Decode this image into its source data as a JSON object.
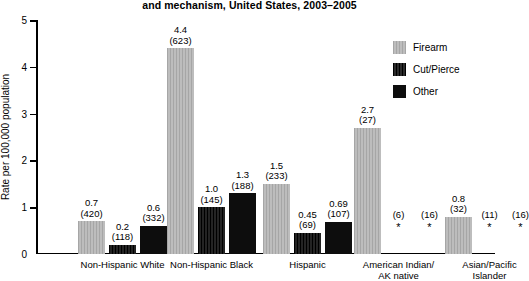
{
  "chart_data": {
    "type": "bar",
    "title": "and mechanism, United States, 2003–2005",
    "xlabel": "",
    "ylabel": "Rate per 100,000 population",
    "ylim": [
      0,
      5
    ],
    "yticks": [
      "0",
      "1",
      "2",
      "3",
      "4",
      "5"
    ],
    "grid": false,
    "legend_position": "top-right",
    "categories": [
      "Non-Hispanic White",
      "Non-Hispanic Black",
      "Hispanic",
      "American Indian/\nAK native",
      "Asian/Pacific\nIslander"
    ],
    "series": [
      {
        "name": "Firearm",
        "color": "#b3b3b3",
        "values": [
          0.7,
          4.4,
          1.5,
          2.7,
          0.8
        ],
        "rate_labels": [
          "0.7",
          "4.4",
          "1.5",
          "2.7",
          "0.8"
        ],
        "count_labels": [
          "(420)",
          "(623)",
          "(233)",
          "(27)",
          "(32)"
        ],
        "suppressed": [
          false,
          false,
          false,
          false,
          false
        ]
      },
      {
        "name": "Cut/Pierce",
        "color": "#161616",
        "values": [
          0.2,
          1.0,
          0.45,
          null,
          null
        ],
        "rate_labels": [
          "0.2",
          "1.0",
          "0.45",
          "",
          ""
        ],
        "count_labels": [
          "(118)",
          "(145)",
          "(69)",
          "(6)",
          "(11)"
        ],
        "suppressed": [
          false,
          false,
          false,
          true,
          true
        ]
      },
      {
        "name": "Other",
        "color": "#0d0d0d",
        "values": [
          0.6,
          1.3,
          0.69,
          null,
          null
        ],
        "rate_labels": [
          "0.6",
          "1.3",
          "0.69",
          "",
          ""
        ],
        "count_labels": [
          "(332)",
          "(188)",
          "(107)",
          "(16)",
          "(16)"
        ],
        "suppressed": [
          false,
          false,
          false,
          true,
          true
        ]
      }
    ],
    "suppression_marker": "*"
  },
  "legend": {
    "items": [
      {
        "label": "Firearm"
      },
      {
        "label": "Cut/Pierce"
      },
      {
        "label": "Other"
      }
    ]
  },
  "axis": {
    "y_label": "Rate per 100,000 population",
    "y_ticks": [
      "5",
      "4",
      "3",
      "2",
      "1",
      "0"
    ]
  },
  "categories": [
    {
      "line1": "Non-Hispanic White",
      "line2": ""
    },
    {
      "line1": "Non-Hispanic Black",
      "line2": ""
    },
    {
      "line1": "Hispanic",
      "line2": ""
    },
    {
      "line1": "American Indian/",
      "line2": "AK native"
    },
    {
      "line1": "Asian/Pacific",
      "line2": "Islander"
    }
  ],
  "title": {
    "text": "and mechanism, United States, 2003–2005"
  }
}
